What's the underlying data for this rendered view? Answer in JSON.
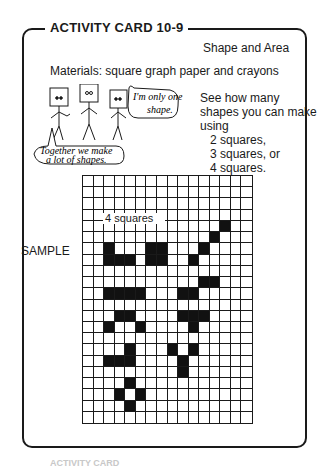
{
  "card": {
    "title": "ACTIVITY CARD 10-9",
    "subject": "Shape and Area",
    "materials": "Materials: square graph paper and crayons",
    "instructions": {
      "line1": "See how many",
      "line2": "shapes you can make",
      "line3": "using",
      "options": [
        "2 squares,",
        "3 squares, or",
        "4 squares."
      ]
    },
    "illustration": {
      "speech_single": [
        "I'm only one",
        "shape."
      ],
      "speech_group": [
        "Together we make",
        "a lot of shapes."
      ]
    },
    "sample_label": "SAMPLE",
    "grid": {
      "label": "4 squares",
      "columns": 16,
      "rows": 22,
      "filled_cells": [
        [
          4,
          13
        ],
        [
          5,
          12
        ],
        [
          6,
          2
        ],
        [
          6,
          6
        ],
        [
          6,
          7
        ],
        [
          6,
          11
        ],
        [
          7,
          2
        ],
        [
          7,
          3
        ],
        [
          7,
          4
        ],
        [
          7,
          6
        ],
        [
          7,
          7
        ],
        [
          7,
          10
        ],
        [
          9,
          11
        ],
        [
          9,
          12
        ],
        [
          10,
          2
        ],
        [
          10,
          3
        ],
        [
          10,
          4
        ],
        [
          10,
          5
        ],
        [
          10,
          9
        ],
        [
          10,
          10
        ],
        [
          12,
          3
        ],
        [
          12,
          4
        ],
        [
          12,
          9
        ],
        [
          12,
          10
        ],
        [
          12,
          11
        ],
        [
          13,
          2
        ],
        [
          13,
          5
        ],
        [
          13,
          10
        ],
        [
          15,
          4
        ],
        [
          15,
          8
        ],
        [
          15,
          10
        ],
        [
          16,
          2
        ],
        [
          16,
          3
        ],
        [
          16,
          4
        ],
        [
          16,
          9
        ],
        [
          17,
          9
        ],
        [
          18,
          4
        ],
        [
          19,
          3
        ],
        [
          19,
          5
        ],
        [
          20,
          4
        ]
      ]
    }
  },
  "footer_ghost": "ACTIVITY CARD"
}
